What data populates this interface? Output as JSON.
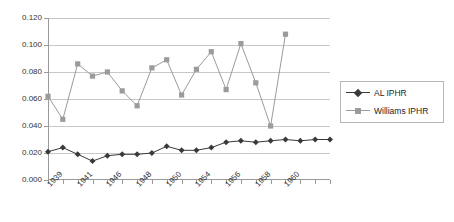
{
  "chart_data": {
    "type": "line",
    "title": "",
    "xlabel": "",
    "ylabel": "",
    "ylim": [
      0.0,
      0.12
    ],
    "ytick_values": [
      0.0,
      0.02,
      0.04,
      0.06,
      0.08,
      0.1,
      0.12
    ],
    "ytick_labels": [
      "0.000",
      "0.020",
      "0.040",
      "0.060",
      "0.080",
      "0.100",
      "0.120"
    ],
    "grid": true,
    "legend_position": "right",
    "categories": [
      "1939",
      "1940",
      "1941",
      "1942",
      "1946",
      "1947",
      "1948",
      "1949",
      "1950",
      "1951",
      "1954",
      "1955",
      "1956",
      "1957",
      "1958",
      "1959",
      "1960",
      "1961",
      "1962",
      "1963"
    ],
    "xtick_labels_shown": [
      "1939",
      "",
      "1941",
      "",
      "1946",
      "",
      "1948",
      "",
      "1950",
      "",
      "1954",
      "",
      "1956",
      "",
      "1958",
      "",
      "1960",
      "",
      "",
      ""
    ],
    "series": [
      {
        "name": "AL IPHR",
        "marker": "diamond",
        "color": "#3a3a3a",
        "values": [
          0.021,
          0.024,
          0.019,
          0.014,
          0.018,
          0.019,
          0.019,
          0.02,
          0.025,
          0.022,
          0.022,
          0.024,
          0.028,
          0.029,
          0.028,
          0.029,
          0.03,
          0.029,
          0.03,
          0.03
        ]
      },
      {
        "name": "Williams IPHR",
        "marker": "square",
        "color": "#9b9b9b",
        "values": [
          0.062,
          0.045,
          0.086,
          0.077,
          0.08,
          0.066,
          0.055,
          0.083,
          0.089,
          0.063,
          0.082,
          0.095,
          0.067,
          0.101,
          0.072,
          0.04,
          0.108,
          null,
          null,
          null
        ]
      }
    ]
  },
  "legend": {
    "entries": [
      {
        "label": "AL IPHR"
      },
      {
        "label": "Williams IPHR"
      }
    ]
  }
}
